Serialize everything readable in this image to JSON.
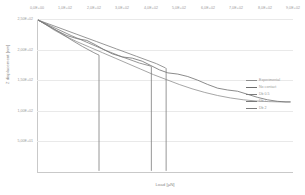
{
  "chart_data": {
    "type": "line",
    "title": "",
    "xlabel": "Load [µN]",
    "ylabel": "Z displacement [nm]",
    "xlim": [
      0,
      900
    ],
    "ylim": [
      -250,
      250
    ],
    "grid": true,
    "legend_position": "right",
    "x_tick_labels": [
      "0,0E+00",
      "1,0E+02",
      "2,0E+02",
      "3,0E+02",
      "4,0E+02",
      "5,0E+02",
      "6,0E+02",
      "7,0E+02",
      "8,0E+02",
      "9,0E+02"
    ],
    "x_tick_values": [
      0,
      100,
      200,
      300,
      400,
      500,
      600,
      700,
      800,
      900
    ],
    "y_tick_labels": [
      "2,50E+02",
      "2,00E+02",
      "1,50E+02",
      "1,00E+02",
      "5,00E+01"
    ],
    "y_tick_values": [
      250,
      200,
      150,
      100,
      50
    ],
    "series": [
      {
        "name": "Experimental",
        "color": "#8f8f8f",
        "x": [
          5,
          30,
          60,
          95,
          140,
          185,
          230,
          275,
          320,
          365,
          410,
          455,
          500,
          545,
          590,
          635,
          680,
          725,
          770,
          815,
          860,
          890
        ],
        "y": [
          246,
          232,
          214,
          196,
          176,
          158,
          140,
          122,
          104,
          86,
          68,
          52,
          36,
          22,
          10,
          0,
          -8,
          -14,
          -18,
          -20,
          -21,
          -21
        ]
      },
      {
        "name": "No contact",
        "color": "#6d6d6d",
        "x": [
          5,
          35,
          70,
          105,
          140,
          175,
          205,
          235,
          265,
          300,
          335,
          370,
          400,
          430,
          460,
          495,
          530,
          565,
          600,
          635,
          670,
          705,
          740,
          775,
          810,
          845,
          875,
          890
        ],
        "y": [
          246,
          230,
          212,
          196,
          186,
          180,
          166,
          150,
          136,
          126,
          122,
          112,
          98,
          84,
          74,
          70,
          62,
          50,
          36,
          24,
          18,
          14,
          4,
          -6,
          -14,
          -19,
          -21,
          -21
        ]
      },
      {
        "name": "Db 0.5",
        "color": "#7c7c7c",
        "x": [
          5,
          40,
          80,
          120,
          160,
          200,
          218,
          218
        ],
        "y": [
          246,
          228,
          206,
          182,
          160,
          140,
          132,
          -245
        ],
        "note": "terminates in vertical unload drop"
      },
      {
        "name": "Db 1",
        "color": "#7c7c7c",
        "x": [
          5,
          60,
          120,
          180,
          240,
          300,
          360,
          400,
          402,
          402
        ],
        "y": [
          246,
          222,
          196,
          172,
          148,
          126,
          106,
          96,
          94,
          -245
        ],
        "note": "terminates in vertical unload drop"
      },
      {
        "name": "Db 2",
        "color": "#7c7c7c",
        "x": [
          5,
          70,
          140,
          210,
          280,
          350,
          420,
          452,
          454,
          454
        ],
        "y": [
          246,
          224,
          200,
          176,
          152,
          128,
          104,
          90,
          88,
          -245
        ],
        "note": "terminates in vertical unload drop"
      }
    ],
    "legend_entries": [
      {
        "label": "Experimental",
        "color": "#8f8f8f"
      },
      {
        "label": "No contact",
        "color": "#6d6d6d"
      },
      {
        "label": "Db 0.5",
        "color": "#7c7c7c"
      },
      {
        "label": "Db 1",
        "color": "#7c7c7c"
      },
      {
        "label": "Db 2",
        "color": "#7c7c7c"
      }
    ]
  }
}
